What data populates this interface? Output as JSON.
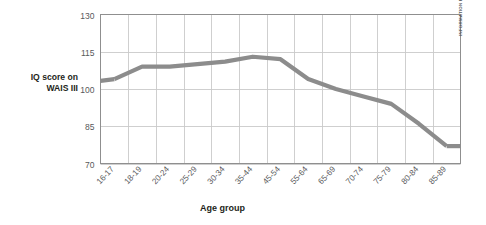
{
  "chart_data": {
    "type": "line",
    "title": "",
    "xlabel": "Age group",
    "ylabel": "IQ score on WAIS III",
    "ylim": [
      70,
      130
    ],
    "yticks": [
      70,
      85,
      100,
      115,
      130
    ],
    "grid": true,
    "legend": false,
    "categories": [
      "16-17",
      "18-19",
      "20-24",
      "25-29",
      "30-34",
      "35-44",
      "45-54",
      "55-64",
      "65-69",
      "70-74",
      "75-79",
      "80-84",
      "85-89"
    ],
    "values": [
      104,
      109,
      109,
      110,
      111,
      113,
      112,
      104,
      100,
      97,
      94,
      86,
      77
    ],
    "series": [
      {
        "name": "IQ score on WAIS III",
        "color": "#8c8c8c",
        "values": [
          104,
          109,
          109,
          110,
          111,
          113,
          112,
          104,
          100,
          97,
          94,
          86,
          77
        ]
      }
    ],
    "annotations": [
      "INFORMATION FROM KAUFMAN, 2001."
    ]
  },
  "axes": {
    "y_title_line1": "IQ score on",
    "y_title_line2": "WAIS III",
    "x_title": "Age group",
    "y_tick_labels": [
      "130",
      "115",
      "100",
      "85",
      "70"
    ],
    "x_tick_labels": [
      "16-17",
      "18-19",
      "20-24",
      "25-29",
      "30-34",
      "35-44",
      "45-54",
      "55-64",
      "65-69",
      "70-74",
      "75-79",
      "80-84",
      "85-89"
    ]
  },
  "source": {
    "credit": "INFORMATION FROM KAUFMAN, 2001."
  },
  "colors": {
    "line": "#8c8c8c",
    "grid": "#c9c9c9",
    "frame": "#8f8f8f",
    "text": "#231f20",
    "tick_text": "#58595b",
    "background": "#ffffff"
  }
}
